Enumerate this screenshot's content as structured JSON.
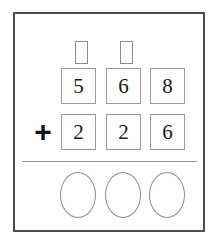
{
  "worksheet": {
    "problem_type": "column-addition",
    "operator": "+",
    "carry_boxes": [
      {
        "name": "hundreds-carry",
        "value": ""
      },
      {
        "name": "tens-carry",
        "value": ""
      }
    ],
    "addend_rows": [
      {
        "label": "first-addend",
        "digits": [
          "5",
          "6",
          "8"
        ]
      },
      {
        "label": "second-addend",
        "digits": [
          "2",
          "2",
          "6"
        ]
      }
    ],
    "answer_slots": [
      {
        "name": "hundreds-answer",
        "value": ""
      },
      {
        "name": "tens-answer",
        "value": ""
      },
      {
        "name": "ones-answer",
        "value": ""
      }
    ],
    "colors": {
      "frame": "#4d4d4d",
      "box_border": "#9a9a9a",
      "carry_border": "#8c8c8c",
      "oval_border": "#8c8c8c",
      "rule": "#9a9a9a",
      "digit_text": "#1a1a1a",
      "operator_text": "#111111",
      "background": "#ffffff"
    }
  }
}
